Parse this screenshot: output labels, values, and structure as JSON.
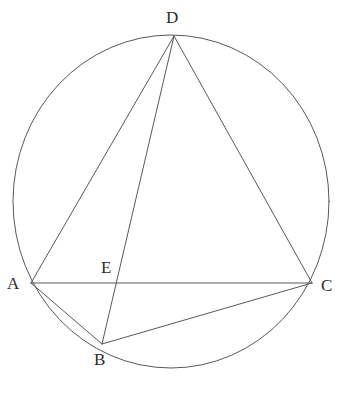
{
  "figure": {
    "background_color": "#ffffff",
    "stroke_color": "#585858",
    "label_color": "#2b2b2b",
    "stroke_width": 1.0,
    "width": 339,
    "height": 393
  },
  "chart_data": {
    "type": "diagram",
    "subtype": "euclidean-geometry",
    "circle": {
      "name": "circumscribed-circle",
      "center_x": 171,
      "center_y": 201.5,
      "radius_x": 158,
      "radius_y": 166.5,
      "filled": false
    },
    "points": [
      {
        "id": "A",
        "label": "A",
        "x": 31,
        "y": 283,
        "label_x": 7,
        "label_y": 275,
        "on_circle": true
      },
      {
        "id": "B",
        "label": "B",
        "x": 102,
        "y": 344,
        "label_x": 94,
        "label_y": 351,
        "on_circle": true
      },
      {
        "id": "C",
        "label": "C",
        "x": 312,
        "y": 283,
        "label_x": 321,
        "label_y": 277,
        "on_circle": true
      },
      {
        "id": "D",
        "label": "D",
        "x": 174,
        "y": 36,
        "label_x": 166,
        "label_y": 9,
        "on_circle": true
      },
      {
        "id": "E",
        "label": "E",
        "x": 116,
        "y": 283,
        "label_x": 101,
        "label_y": 259,
        "on_circle": false
      }
    ],
    "segments": [
      {
        "id": "AD",
        "from": "A",
        "to": "D",
        "label": "A to D"
      },
      {
        "id": "AC",
        "from": "A",
        "to": "C",
        "label": "A to C"
      },
      {
        "id": "AB",
        "from": "A",
        "to": "B",
        "label": "A to B"
      },
      {
        "id": "DB",
        "from": "D",
        "to": "B",
        "label": "D to B"
      },
      {
        "id": "DC",
        "from": "D",
        "to": "C",
        "label": "D to C"
      },
      {
        "id": "BC",
        "from": "B",
        "to": "C",
        "label": "B to C"
      }
    ],
    "intersections": [
      {
        "id": "E",
        "of": [
          "AC",
          "DB"
        ],
        "x": 116,
        "y": 283
      }
    ],
    "xlabel": "",
    "ylabel": "",
    "grid": false,
    "legend": false
  }
}
